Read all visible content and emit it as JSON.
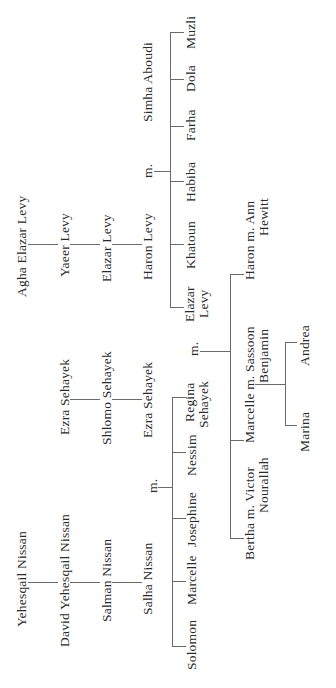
{
  "orientation": "rotated 90° counter-clockwise",
  "colors": {
    "text": "#2a2a2a",
    "lines": "#6a6a6a",
    "background": "#ffffff"
  },
  "levy_line": {
    "gen1": "Agha Elazar Levy",
    "gen2": "Yaeer Levy",
    "gen3": "Elazar Levy",
    "gen4": "Haron Levy",
    "marriage_marker": "m.",
    "spouse": "Simha Aboudi",
    "children": [
      "Elazar Levy",
      "Khatoun",
      "Habiba",
      "Farha",
      "Dola",
      "Muzli"
    ]
  },
  "sehayek_line": {
    "gen1": "Ezra Sehayek",
    "gen2": "Shlomo Sehayek",
    "gen3": "Ezra Sehayek"
  },
  "nissan_line": {
    "gen1": "Yehesqail Nissan",
    "gen2": "David Yehesqail Nissan",
    "gen3": "Salman Nissan",
    "gen4": "Salha Nissan",
    "marriage_marker": "m.",
    "children": [
      "Solomon",
      "Marcelle",
      "Josephine",
      "Nessim",
      "Regina Sehayek"
    ]
  },
  "union": {
    "marriage_marker": "m.",
    "partner_a": [
      "Elazar",
      "Levy"
    ],
    "partner_b": [
      "Regina",
      "Sehayek"
    ],
    "children": [
      {
        "line1": "Bertha m. Victor",
        "line2": "Nourallah"
      },
      {
        "line1": "Marcelle m. Sassoon",
        "line2": "Benjamin"
      },
      {
        "line1": "Haron m. Ann",
        "line2": "Hewitt"
      }
    ],
    "grandchildren": [
      "Marina",
      "Andrea"
    ]
  }
}
